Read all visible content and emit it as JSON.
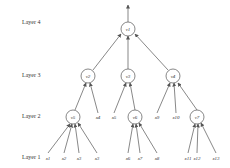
{
  "diagram": {
    "layers": [
      {
        "label": "Layer 4"
      },
      {
        "label": "Layer 3"
      },
      {
        "label": "Layer 2"
      },
      {
        "label": "Layer 1"
      }
    ],
    "nodes": {
      "root": {
        "label": "v1"
      },
      "l3": [
        {
          "label": "v2"
        },
        {
          "label": "v3"
        },
        {
          "label": "v4"
        }
      ],
      "l2": [
        {
          "label": "v5"
        },
        {
          "label": "v6"
        },
        {
          "label": "v7"
        }
      ]
    },
    "inputs_layer2": [
      "x4",
      "x5",
      "x9",
      "x10"
    ],
    "inputs_layer1": [
      "x1",
      "x2",
      "x3",
      "x3",
      "x6",
      "x7",
      "x8",
      "x11",
      "x12",
      "x13"
    ],
    "colors": {
      "stroke": "#555555",
      "text": "#333333",
      "background": "#ffffff"
    }
  }
}
